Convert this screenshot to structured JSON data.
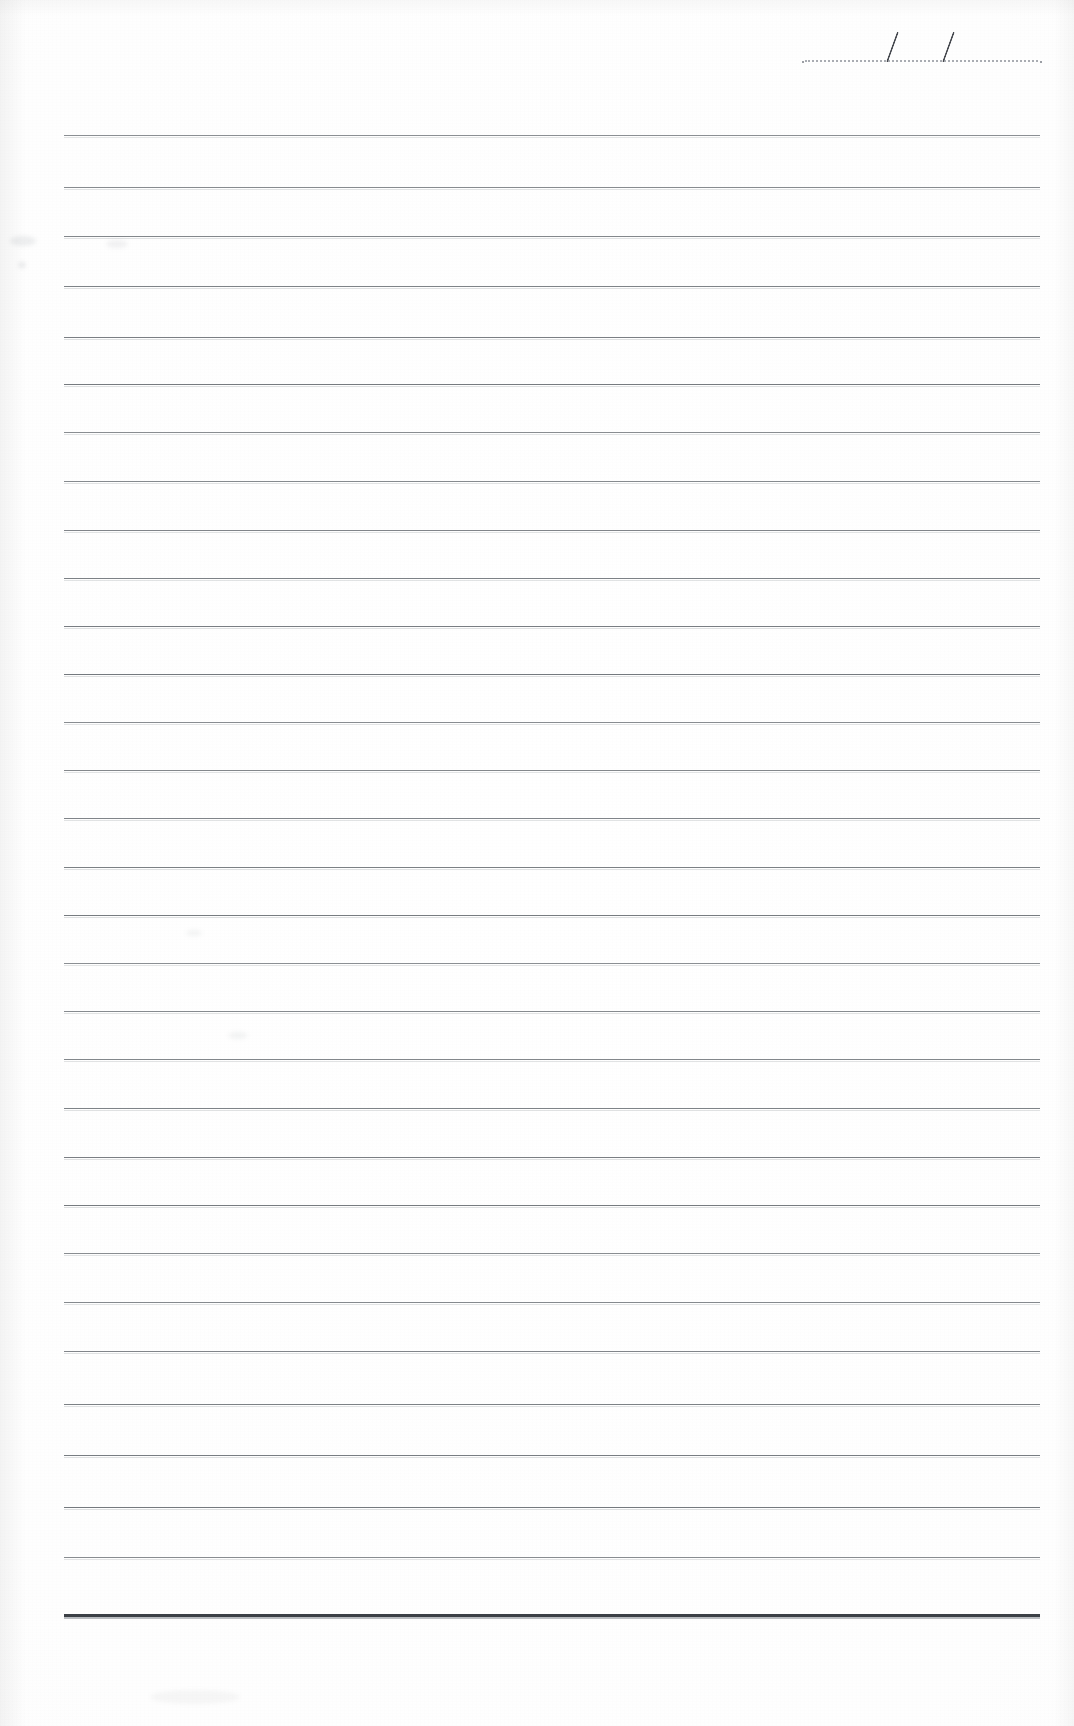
{
  "document": {
    "type": "ruled-notepad-page",
    "title": "Blank ruled notepad page",
    "page_width": 1074,
    "page_height": 1726,
    "background_color": "#fdfdfd",
    "content_text": ""
  },
  "date_field": {
    "name": "date-line",
    "value": "",
    "placeholder": "",
    "separator_1": "/",
    "separator_2": "/",
    "dotline_color": "#a9acb2",
    "slash_color": "#46494f",
    "dotline_left": 805,
    "dotline_right": 1038,
    "dotline_y": 60,
    "slash_positions": [
      886,
      942
    ]
  },
  "rules": {
    "name": "ruled-lines",
    "count": 29,
    "left": 64,
    "right": 1040,
    "first_y": 135,
    "spacing": 52,
    "color": "#6f7479",
    "bottom_rule": {
      "y": 1614,
      "color": "#3c4046",
      "thickness": 3,
      "label": "bottom-border-rule"
    },
    "y_positions": [
      135,
      187,
      236,
      286,
      337,
      384,
      432,
      481,
      530,
      578,
      626,
      674,
      722,
      770,
      818,
      867,
      915,
      963,
      1011,
      1059,
      1108,
      1157,
      1205,
      1253,
      1302,
      1351,
      1404,
      1455,
      1507,
      1557
    ]
  },
  "artifacts": {
    "name": "scan-artifacts",
    "smudges": [
      {
        "x": 10,
        "y": 236,
        "w": 26,
        "h": 10,
        "opacity": 0.1
      },
      {
        "x": 106,
        "y": 240,
        "w": 22,
        "h": 8,
        "opacity": 0.08
      },
      {
        "x": 18,
        "y": 262,
        "w": 8,
        "h": 6,
        "opacity": 0.12
      },
      {
        "x": 186,
        "y": 930,
        "w": 16,
        "h": 6,
        "opacity": 0.07
      },
      {
        "x": 228,
        "y": 1032,
        "w": 20,
        "h": 7,
        "opacity": 0.07
      },
      {
        "x": 150,
        "y": 1690,
        "w": 90,
        "h": 14,
        "opacity": 0.05
      }
    ]
  }
}
